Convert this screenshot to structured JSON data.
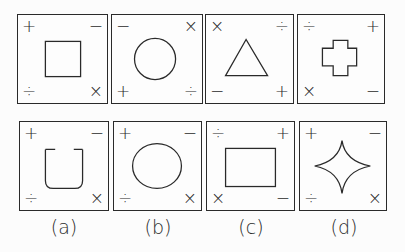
{
  "problem_figures": [
    {
      "tl": "+",
      "tr": "−",
      "bl": "÷",
      "br": "×",
      "shape": "square"
    },
    {
      "tl": "−",
      "tr": "×",
      "bl": "+",
      "br": "÷",
      "shape": "circle"
    },
    {
      "tl": "×",
      "tr": "÷",
      "bl": "−",
      "br": "+",
      "shape": "triangle"
    },
    {
      "tl": "÷",
      "tr": "+",
      "bl": "×",
      "br": "−",
      "shape": "cross"
    }
  ],
  "answer_figures": [
    {
      "label": "(a)",
      "tl": "+",
      "tr": "−",
      "bl": "÷",
      "br": "×",
      "shape": "open-cup"
    },
    {
      "label": "(b)",
      "tl": "+",
      "tr": "−",
      "bl": "÷",
      "br": "×",
      "shape": "ellipse"
    },
    {
      "label": "(c)",
      "tl": "÷",
      "tr": "+",
      "bl": "×",
      "br": "−",
      "shape": "rectangle"
    },
    {
      "label": "(d)",
      "tl": "+",
      "tr": "−",
      "bl": "÷",
      "br": "×",
      "shape": "four-point-star"
    }
  ]
}
